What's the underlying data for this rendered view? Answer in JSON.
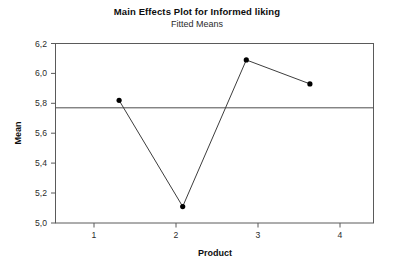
{
  "chart_data": {
    "type": "line",
    "title": "Main Effects Plot for Informed liking",
    "subtitle": "Fitted Means",
    "xlabel": "Product",
    "ylabel": "Mean",
    "categories": [
      "1",
      "2",
      "3",
      "4"
    ],
    "x": [
      1,
      2,
      3,
      4
    ],
    "values": [
      5.82,
      5.11,
      6.09,
      5.93
    ],
    "series": [
      {
        "name": "Fitted Means",
        "values": [
          5.82,
          5.11,
          6.09,
          5.93
        ]
      }
    ],
    "ylim": [
      5.0,
      6.2
    ],
    "ytick_labels": [
      "5,0",
      "5,2",
      "5,4",
      "5,6",
      "5,8",
      "6,0",
      "6,2"
    ],
    "ytick_values": [
      5.0,
      5.2,
      5.4,
      5.6,
      5.8,
      6.0,
      6.2
    ],
    "xtick_labels": [
      "1",
      "2",
      "3",
      "4"
    ],
    "xtick_values": [
      1,
      2,
      3,
      4
    ],
    "reference_line": {
      "label": "grand mean",
      "value": 5.77,
      "orientation": "horizontal"
    },
    "grid": false,
    "legend": null,
    "decimal_separator": ",",
    "marker": "circle",
    "colors": {
      "line": "#3d3d3d",
      "marker": "#000000",
      "reference_line": "#4d4d4d",
      "frame": "#5a5a5a",
      "background": "#ffffff"
    }
  }
}
